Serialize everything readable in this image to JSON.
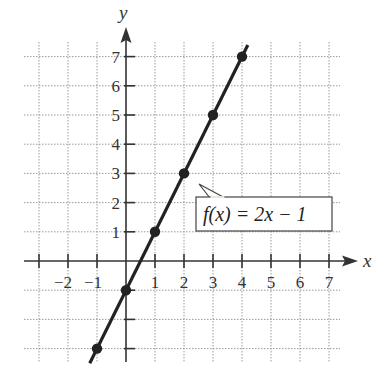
{
  "chart_data": {
    "type": "line",
    "title": "",
    "function_label": "f(x) = 2x − 1",
    "xlabel": "x",
    "ylabel": "y",
    "xlim": [
      -3,
      7
    ],
    "ylim": [
      -3,
      7
    ],
    "grid": true,
    "x_tick_labels": [
      "−2",
      "−1",
      "1",
      "2",
      "3",
      "4",
      "5",
      "6",
      "7"
    ],
    "y_tick_labels": [
      "1",
      "2",
      "3",
      "4",
      "5",
      "6",
      "7"
    ],
    "series": [
      {
        "name": "f(x) = 2x − 1",
        "points": [
          {
            "x": -1,
            "y": -3
          },
          {
            "x": 0,
            "y": -1
          },
          {
            "x": 1,
            "y": 1
          },
          {
            "x": 2,
            "y": 3
          },
          {
            "x": 3,
            "y": 5
          },
          {
            "x": 4,
            "y": 7
          }
        ]
      }
    ],
    "colors": {
      "line": "#222222",
      "axis": "#333333",
      "grid": "#9a9a9a"
    }
  }
}
